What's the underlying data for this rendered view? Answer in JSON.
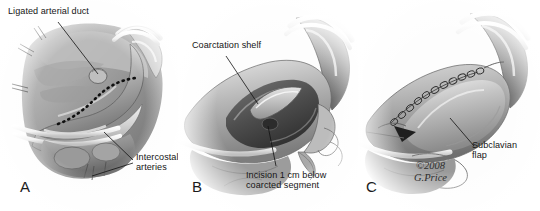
{
  "figure": {
    "background_color": "#ffffff",
    "ink_color": "#161616",
    "style": "grayscale medical illustration, three panels"
  },
  "signature": {
    "copyright": "©2008",
    "artist": "G.Price"
  },
  "panels": [
    {
      "letter": "A",
      "name": "panel-a",
      "caption": "Exposure: ligated arterial duct and intercostal arteries with planned incision",
      "labels": [
        {
          "name": "ligated-arterial-duct",
          "lines": [
            "Ligated arterial duct"
          ]
        },
        {
          "name": "intercostal-arteries",
          "lines": [
            "Intercostal",
            "arteries"
          ]
        }
      ]
    },
    {
      "letter": "B",
      "name": "panel-b",
      "caption": "Aorta opened showing coarctation shelf and incision extent",
      "labels": [
        {
          "name": "coarctation-shelf",
          "lines": [
            "Coarctation shelf"
          ]
        },
        {
          "name": "incision-site",
          "lines": [
            "Incision 1 cm below",
            "coarcted segment"
          ]
        }
      ]
    },
    {
      "letter": "C",
      "name": "panel-c",
      "caption": "Completed repair with sutured subclavian flap",
      "labels": [
        {
          "name": "subclavian-flap",
          "lines": [
            "Subclavian",
            "flap"
          ]
        }
      ]
    }
  ]
}
